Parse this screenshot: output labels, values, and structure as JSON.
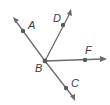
{
  "diagram": {
    "type": "rays-from-common-endpoint",
    "vertex": {
      "label": "B",
      "x": 45,
      "y": 61,
      "label_x": 35,
      "label_y": 72
    },
    "colors": {
      "line": "#6b6b6b",
      "point": "#5a5a5a",
      "label": "#3a3a3a"
    },
    "rays": [
      {
        "id": "BA",
        "point_label": "A",
        "tip": [
          13,
          17
        ],
        "point": [
          23,
          31
        ],
        "label_pos": [
          28,
          29
        ]
      },
      {
        "id": "BD",
        "point_label": "D",
        "tip": [
          71,
          10
        ],
        "point": [
          63,
          25
        ],
        "label_pos": [
          53,
          22
        ]
      },
      {
        "id": "BF",
        "point_label": "F",
        "tip": [
          106,
          59
        ],
        "point": [
          85,
          60
        ],
        "label_pos": [
          85,
          54
        ]
      },
      {
        "id": "BC",
        "point_label": "C",
        "tip": [
          75,
          100
        ],
        "point": [
          66,
          88
        ],
        "label_pos": [
          71,
          87
        ]
      }
    ]
  },
  "labels": {
    "A": "A",
    "B": "B",
    "C": "C",
    "D": "D",
    "F": "F"
  }
}
